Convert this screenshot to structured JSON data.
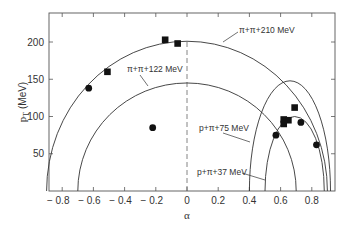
{
  "chart_data": {
    "type": "scatter",
    "title": "",
    "xlabel": "α",
    "ylabel": "p_T (MeV)",
    "xlim": [
      -0.88,
      0.94
    ],
    "ylim": [
      0,
      235
    ],
    "xticks": [
      -0.8,
      -0.6,
      -0.4,
      -0.2,
      0,
      0.2,
      0.4,
      0.6,
      0.8
    ],
    "xtick_labels": [
      "− 0.8",
      "− 0.6",
      "− 0.4",
      "− 0.2",
      "0",
      "0.2",
      "0.4",
      "0.6",
      "0.8"
    ],
    "yticks": [
      50,
      100,
      150,
      200
    ],
    "ytick_labels": [
      "50",
      "100",
      "150",
      "200"
    ],
    "grid": false,
    "reference_line": {
      "type": "vertical-dashed",
      "x": 0
    },
    "curves": [
      {
        "name": "π+π+210 MeV",
        "label": "π+π+210 MeV",
        "center_alpha": 0.0,
        "alpha_halfwidth": 0.9,
        "pt_max": 201
      },
      {
        "name": "π+π+122 MeV",
        "label": "π+π+122 MeV",
        "center_alpha": 0.0,
        "alpha_halfwidth": 0.7,
        "pt_max": 145
      },
      {
        "name": "p+π+75 MeV",
        "label": "p+π+75 MeV",
        "center_alpha": 0.66,
        "alpha_halfwidth": 0.26,
        "pt_max": 148
      },
      {
        "name": "p+π+37 MeV",
        "label": "p+π+37 MeV",
        "center_alpha": 0.69,
        "alpha_halfwidth": 0.19,
        "pt_max": 100
      }
    ],
    "series": [
      {
        "name": "squares",
        "marker": "square",
        "points": [
          {
            "x": -0.51,
            "y": 160
          },
          {
            "x": -0.14,
            "y": 203
          },
          {
            "x": -0.06,
            "y": 198
          },
          {
            "x": 0.69,
            "y": 112
          },
          {
            "x": 0.62,
            "y": 96
          },
          {
            "x": 0.65,
            "y": 95
          },
          {
            "x": 0.62,
            "y": 90
          }
        ]
      },
      {
        "name": "circles",
        "marker": "circle",
        "points": [
          {
            "x": -0.63,
            "y": 138
          },
          {
            "x": -0.22,
            "y": 85
          },
          {
            "x": 0.57,
            "y": 75
          },
          {
            "x": 0.73,
            "y": 92
          },
          {
            "x": 0.83,
            "y": 62
          }
        ]
      }
    ]
  },
  "labels": {
    "y_axis_title": "p",
    "y_axis_sub": "T",
    "y_axis_unit": " (MeV)",
    "x_axis_title": "α",
    "curve_210": "π+π+210 MeV",
    "curve_122": "π+π+122 MeV",
    "curve_75": "p+π+75 MeV",
    "curve_37": "p+π+37 MeV"
  }
}
